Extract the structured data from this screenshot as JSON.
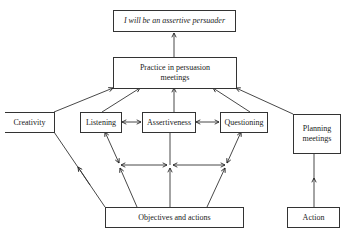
{
  "diagram": {
    "nodes": {
      "goal": {
        "label": "I will be an assertive persuader"
      },
      "practice": {
        "label": "Practice in persuasion meetings"
      },
      "creativity": {
        "label": "Creativity"
      },
      "listening": {
        "label": "Listening"
      },
      "assertiveness": {
        "label": "Assertiveness"
      },
      "questioning": {
        "label": "Questioning"
      },
      "planning": {
        "label": "Planning meetings"
      },
      "objectives": {
        "label": "Objectives and actions"
      },
      "action": {
        "label": "Action"
      }
    },
    "edges": [
      {
        "from": "practice",
        "to": "goal"
      },
      {
        "from": "creativity",
        "to": "practice"
      },
      {
        "from": "listening",
        "to": "practice"
      },
      {
        "from": "assertiveness",
        "to": "practice"
      },
      {
        "from": "questioning",
        "to": "practice"
      },
      {
        "from": "planning",
        "to": "practice"
      },
      {
        "from": "listening",
        "to": "assertiveness",
        "bidirectional": true
      },
      {
        "from": "assertiveness",
        "to": "questioning",
        "bidirectional": true
      },
      {
        "from": "objectives",
        "to": "creativity"
      },
      {
        "from": "action",
        "to": "planning"
      }
    ]
  }
}
